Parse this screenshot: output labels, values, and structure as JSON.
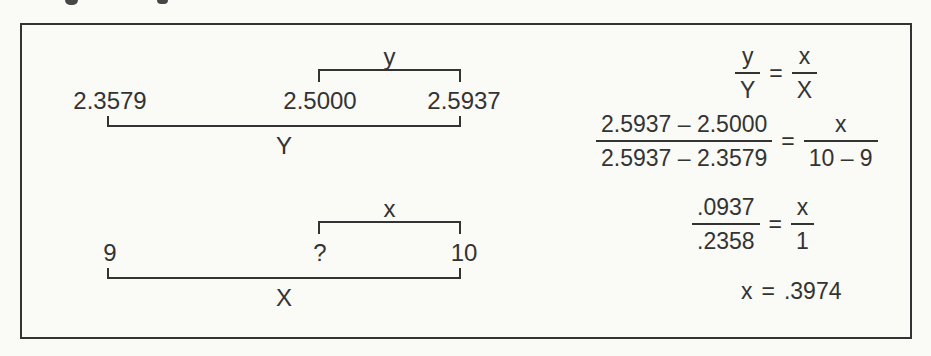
{
  "figure": {
    "colors": {
      "ink": "#333333",
      "paper": "#fafaf7"
    },
    "diagrams": [
      {
        "top_label": "y",
        "values": [
          "2.3579",
          "2.5000",
          "2.5937"
        ],
        "bottom_label": "Y"
      },
      {
        "top_label": "x",
        "values": [
          "9",
          "?",
          "10"
        ],
        "bottom_label": "X"
      }
    ],
    "equations": [
      {
        "left_num": "y",
        "left_den": "Y",
        "equals": "=",
        "right_num": "x",
        "right_den": "X"
      },
      {
        "left_num": "2.5937 – 2.5000",
        "left_den": "2.5937 – 2.3579",
        "equals": "=",
        "right_num": "x",
        "right_den": "10 – 9"
      },
      {
        "left_num": ".0937",
        "left_den": ".2358",
        "equals": "=",
        "right_num": "x",
        "right_den": "1"
      },
      {
        "lhs": "x",
        "equals": "=",
        "rhs": ".3974"
      }
    ]
  }
}
